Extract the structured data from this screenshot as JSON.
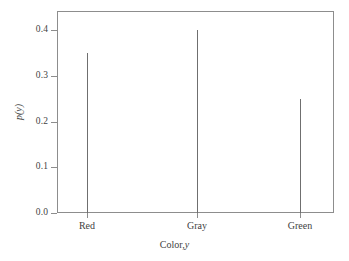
{
  "chart_data": {
    "type": "bar",
    "subtype": "stem",
    "title": "",
    "subtitle": "",
    "categories": [
      "Red",
      "Gray",
      "Green"
    ],
    "values": [
      0.35,
      0.4,
      0.25
    ],
    "series": [
      {
        "name": "p(y)",
        "values": [
          0.35,
          0.4,
          0.25
        ]
      }
    ],
    "xlabel_text": "Color,",
    "xlabel_variable": "y",
    "ylabel": "p(y)",
    "ylim": [
      0.0,
      0.44
    ],
    "yticks": [
      "0.0",
      "0.1",
      "0.2",
      "0.3",
      "0.4"
    ],
    "ytick_values": [
      0.0,
      0.1,
      0.2,
      0.3,
      0.4
    ],
    "xtick_labels": [
      "Red",
      "Gray",
      "Green"
    ],
    "grid": false,
    "legend": "none",
    "colors": {
      "stem": "#6f6f6f",
      "frame": "#8d8d8d",
      "text": "#3f3f3f",
      "background": "#ffffff"
    }
  }
}
